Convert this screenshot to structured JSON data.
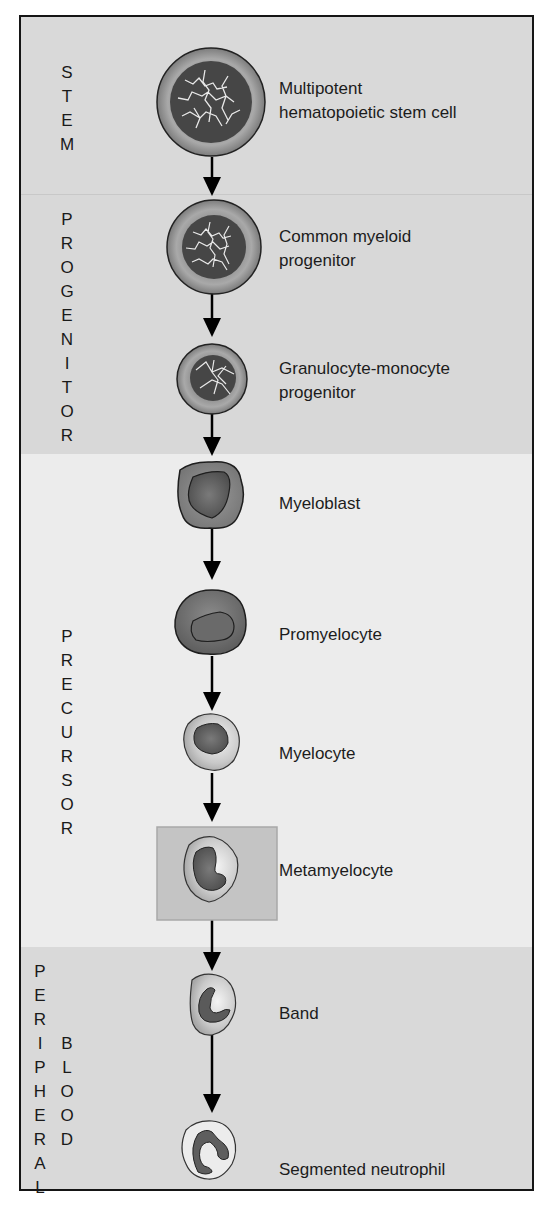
{
  "stages": {
    "stem": {
      "label": "STEM"
    },
    "progenitor": {
      "label": "PROGENITOR"
    },
    "precursor": {
      "label": "PRECURSOR"
    },
    "peripheral_blood": {
      "label_1": "PERIPHERAL",
      "label_2": "BLOOD"
    }
  },
  "cells": [
    {
      "id": "hsc",
      "line1": "Multipotent",
      "line2": "hematopoietic stem cell",
      "stage": "stem"
    },
    {
      "id": "cmp",
      "line1": "Common myeloid",
      "line2": "progenitor",
      "stage": "progenitor"
    },
    {
      "id": "gmp",
      "line1": "Granulocyte-monocyte",
      "line2": "progenitor",
      "stage": "progenitor"
    },
    {
      "id": "myeloblast",
      "line1": "Myeloblast",
      "stage": "precursor"
    },
    {
      "id": "promyelocyte",
      "line1": "Promyelocyte",
      "stage": "precursor"
    },
    {
      "id": "myelocyte",
      "line1": "Myelocyte",
      "stage": "precursor"
    },
    {
      "id": "metamyelocyte",
      "line1": "Metamyelocyte",
      "stage": "precursor",
      "highlighted": true
    },
    {
      "id": "band",
      "line1": "Band",
      "stage": "peripheral_blood"
    },
    {
      "id": "segmented",
      "line1": "Segmented neutrophil",
      "stage": "peripheral_blood"
    }
  ],
  "colors": {
    "stem_band": "#d9d9d9",
    "progenitor_band": "#d8d8d8",
    "precursor_band": "#ececec",
    "peripheral_band": "#d9d9d9",
    "highlight_box": "#c4c4c4",
    "nucleus_dark": "#4a4a4a",
    "frame": "#151515"
  }
}
